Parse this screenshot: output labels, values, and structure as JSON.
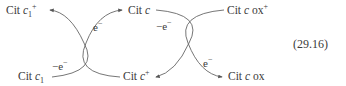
{
  "equation": {
    "number": "(29.16)",
    "species": {
      "top_left": {
        "prefix": "Cit ",
        "var": "c",
        "sub": "1",
        "sup": "+"
      },
      "bottom_left": {
        "prefix": "Cit ",
        "var": "c",
        "sub": "1",
        "sup": ""
      },
      "top_middle": {
        "prefix": "Cit ",
        "var": "c",
        "sub": "",
        "sup": ""
      },
      "bottom_middle": {
        "prefix": "Cit ",
        "var": "c",
        "sub": "",
        "sup": "+"
      },
      "top_right": {
        "prefix": "Cit ",
        "var": "c",
        "suffix": " ox",
        "sup": "+"
      },
      "bottom_right": {
        "prefix": "Cit ",
        "var": "c",
        "suffix": " ox",
        "sup": ""
      }
    },
    "electron_labels": {
      "left_loss": {
        "sign": "−",
        "symbol": "e",
        "charge": "−"
      },
      "left_gain": {
        "sign": "",
        "symbol": "e",
        "charge": "−"
      },
      "right_loss": {
        "sign": "−",
        "symbol": "e",
        "charge": "−"
      },
      "right_gain": {
        "sign": "",
        "symbol": "e",
        "charge": "−"
      }
    }
  },
  "style": {
    "ink": "#3a3a3a",
    "background": "#ffffff"
  }
}
